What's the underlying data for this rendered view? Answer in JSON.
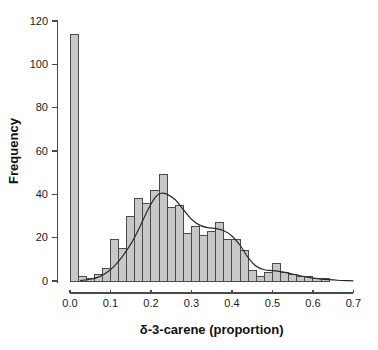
{
  "figure": {
    "background": "#ffffff"
  },
  "chart_data": {
    "type": "bar",
    "subtype": "histogram-with-density-curve",
    "title": "",
    "xlabel": "δ-3-carene (proportion)",
    "ylabel": "Frequency",
    "xlim": [
      0,
      0.7
    ],
    "ylim": [
      0,
      120
    ],
    "grid": false,
    "legend": null,
    "x_tick_values": [
      0.0,
      0.1,
      0.2,
      0.3,
      0.4,
      0.5,
      0.6,
      0.7
    ],
    "x_tick_labels": [
      "0.0",
      "0.1",
      "0.2",
      "0.3",
      "0.4",
      "0.5",
      "0.6",
      "0.7"
    ],
    "y_tick_values": [
      0,
      20,
      40,
      60,
      80,
      100,
      120
    ],
    "y_tick_labels": [
      "0",
      "20",
      "40",
      "60",
      "80",
      "100",
      "120"
    ],
    "bin_width": 0.02,
    "bin_starts": [
      0.0,
      0.02,
      0.04,
      0.06,
      0.08,
      0.1,
      0.12,
      0.14,
      0.16,
      0.18,
      0.2,
      0.22,
      0.24,
      0.26,
      0.28,
      0.3,
      0.32,
      0.34,
      0.36,
      0.38,
      0.4,
      0.42,
      0.44,
      0.46,
      0.48,
      0.5,
      0.52,
      0.54,
      0.56,
      0.58,
      0.6,
      0.62
    ],
    "frequencies": [
      114,
      2,
      1,
      3,
      6,
      19,
      15,
      30,
      38,
      36,
      42,
      49,
      34,
      35,
      22,
      25,
      21,
      23,
      27,
      19,
      19,
      14,
      5,
      2,
      4,
      8,
      4,
      3,
      2,
      2,
      1,
      1
    ],
    "density_curve": {
      "x": [
        0.025,
        0.05,
        0.07,
        0.09,
        0.11,
        0.13,
        0.15,
        0.17,
        0.19,
        0.21,
        0.225,
        0.24,
        0.26,
        0.28,
        0.3,
        0.32,
        0.34,
        0.36,
        0.38,
        0.4,
        0.42,
        0.44,
        0.46,
        0.48,
        0.5,
        0.52,
        0.54,
        0.56,
        0.58,
        0.6,
        0.62,
        0.64,
        0.66,
        0.68,
        0.7
      ],
      "y": [
        0.2,
        0.8,
        1.8,
        3.8,
        7,
        11.5,
        17,
        24,
        32,
        38.5,
        40.5,
        40,
        37.5,
        33,
        28.5,
        25.8,
        24.6,
        24.2,
        23.2,
        20.8,
        16.5,
        10.8,
        6.8,
        5.2,
        4.8,
        4.3,
        3.6,
        2.8,
        2.0,
        1.3,
        0.9,
        0.6,
        0.35,
        0.2,
        0.1
      ]
    },
    "colors": {
      "bar_fill": "#c8c8c8",
      "bar_stroke": "#4a4a4a",
      "curve": "#2a2a2a",
      "axis": "#4a4a4a",
      "text": "#1a1a1a",
      "background": "#ffffff"
    }
  }
}
